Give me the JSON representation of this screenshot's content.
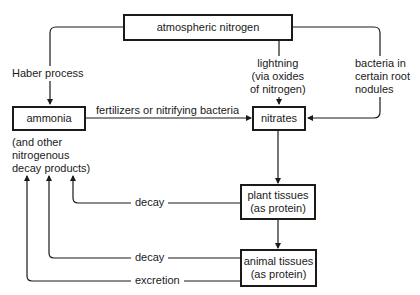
{
  "diagram": {
    "title_clipped": "",
    "nodes": {
      "atmospheric_nitrogen": "atmospheric nitrogen",
      "ammonia": "ammonia",
      "ammonia_note": "(and other\nnitrogenous\ndecay products)",
      "nitrates": "nitrates",
      "plant_tissues": "plant tissues\n(as protein)",
      "animal_tissues": "animal tissues\n(as protein)"
    },
    "edges": {
      "haber": "Haber process",
      "lightning": "lightning\n(via oxides\nof nitrogen)",
      "bacteria_root": "bacteria in\ncertain root\nnodules",
      "fertilizers": "fertilizers or nitrifying bacteria",
      "plant_decay": "decay",
      "animal_decay": "decay",
      "excretion": "excretion"
    },
    "connections": [
      {
        "from": "atmospheric nitrogen",
        "to": "ammonia",
        "label": "Haber process"
      },
      {
        "from": "atmospheric nitrogen",
        "to": "nitrates",
        "label": "lightning (via oxides of nitrogen)"
      },
      {
        "from": "atmospheric nitrogen",
        "to": "nitrates",
        "label": "bacteria in certain root nodules"
      },
      {
        "from": "ammonia",
        "to": "nitrates",
        "label": "fertilizers or nitrifying bacteria"
      },
      {
        "from": "nitrates",
        "to": "plant tissues (as protein)",
        "label": ""
      },
      {
        "from": "plant tissues (as protein)",
        "to": "animal tissues (as protein)",
        "label": ""
      },
      {
        "from": "plant tissues (as protein)",
        "to": "ammonia",
        "label": "decay"
      },
      {
        "from": "animal tissues (as protein)",
        "to": "ammonia",
        "label": "decay"
      },
      {
        "from": "animal tissues (as protein)",
        "to": "ammonia",
        "label": "excretion"
      }
    ]
  }
}
